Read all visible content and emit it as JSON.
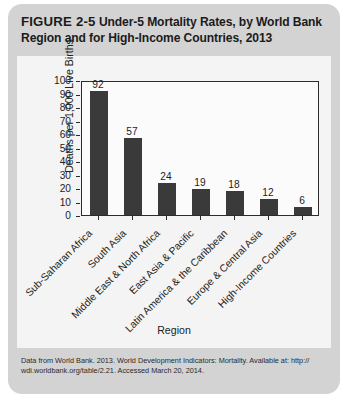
{
  "figure": {
    "number": "FIGURE 2-5",
    "caption": "Under-5 Mortality Rates, by World Bank Region and for High-Income Countries, 2013",
    "source_line1": "Data from World Bank. 2013. World Development Indicators: Mortality. Available at: http://",
    "source_line2": "wdi.worldbank.org/table/2.21. Accessed March 20, 2014."
  },
  "chart_data": {
    "type": "bar",
    "title": "Under-5 Mortality Rates, by World Bank Region and for High-Income Countries, 2013",
    "categories": [
      "Sub-Saharan Africa",
      "South Asia",
      "Middle East & North Africa",
      "East Asia & Pacific",
      "Latin America & the Caribbean",
      "Europe & Central Asia",
      "High-Income Countries"
    ],
    "values": [
      92,
      57,
      24,
      19,
      18,
      12,
      6
    ],
    "xlabel": "Region",
    "ylabel": "Deaths per 1,000 Live Births",
    "ylim": [
      0,
      100
    ],
    "yticks": [
      0,
      10,
      20,
      30,
      40,
      50,
      60,
      70,
      80,
      90,
      100
    ],
    "ytick_labels": [
      "0",
      "10",
      "20",
      "30",
      "40",
      "50",
      "60",
      "70",
      "80",
      "90",
      "100"
    ],
    "grid": false,
    "legend": false,
    "bar_color": "#3a3a3a",
    "label_rotation": -45
  }
}
